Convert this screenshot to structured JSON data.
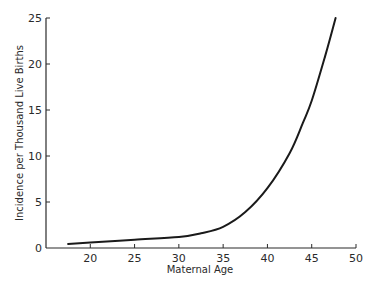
{
  "chart_data": {
    "type": "line",
    "title": "",
    "xlabel": "Maternal Age",
    "ylabel": "Incidence per Thousand Live Births",
    "xlim": [
      15,
      50
    ],
    "ylim": [
      0,
      25
    ],
    "x_ticks": [
      20,
      25,
      30,
      35,
      40,
      45,
      50
    ],
    "y_ticks": [
      0,
      5,
      10,
      15,
      20,
      25
    ],
    "grid": false,
    "legend": null,
    "series": [
      {
        "name": "Incidence",
        "color": "#1a1a1a",
        "x": [
          17.5,
          20,
          25,
          30,
          32.5,
          35,
          37.5,
          40,
          42.5,
          44,
          45,
          46.5,
          47.7
        ],
        "y": [
          0.45,
          0.6,
          0.9,
          1.2,
          1.6,
          2.3,
          3.9,
          6.5,
          10.3,
          13.6,
          16.0,
          20.8,
          25.0
        ]
      }
    ]
  },
  "labels": {
    "xlabel": "Maternal Age",
    "ylabel": "Incidence per Thousand Live Births"
  }
}
